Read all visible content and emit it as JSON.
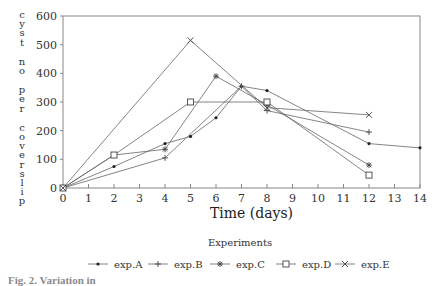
{
  "chart_data": {
    "type": "line",
    "title": "",
    "xlabel": "Time (days)",
    "ylabel": "cyst no per coverslip",
    "xlim": [
      0,
      14
    ],
    "ylim": [
      0,
      600
    ],
    "x_ticks": [
      0,
      1,
      2,
      3,
      4,
      5,
      6,
      7,
      8,
      9,
      10,
      11,
      12,
      13,
      14
    ],
    "y_ticks": [
      0,
      100,
      200,
      300,
      400,
      500,
      600
    ],
    "grid": false,
    "legend_title": "Experiments",
    "legend_position": "bottom",
    "series": [
      {
        "name": "exp.A",
        "marker": "dot",
        "x": [
          0,
          2,
          4,
          5,
          6,
          7,
          8,
          12,
          14
        ],
        "values": [
          0,
          75,
          155,
          180,
          245,
          355,
          340,
          155,
          140
        ]
      },
      {
        "name": "exp.B",
        "marker": "plus",
        "x": [
          0,
          4,
          7,
          8,
          12
        ],
        "values": [
          0,
          105,
          355,
          270,
          195
        ]
      },
      {
        "name": "exp.C",
        "marker": "star",
        "x": [
          0,
          2,
          4,
          6,
          8,
          12
        ],
        "values": [
          0,
          115,
          135,
          390,
          290,
          80
        ]
      },
      {
        "name": "exp.D",
        "marker": "square",
        "x": [
          0,
          2,
          5,
          8,
          12
        ],
        "values": [
          0,
          115,
          300,
          300,
          45
        ]
      },
      {
        "name": "exp.E",
        "marker": "x",
        "x": [
          0,
          5,
          8,
          12
        ],
        "values": [
          0,
          515,
          280,
          255
        ]
      }
    ]
  },
  "axis": {
    "ylabel_words": [
      "cyst",
      "no",
      "per",
      "coverslip"
    ],
    "xlabel": "Time (days)"
  },
  "legend": {
    "title": "Experiments",
    "items": [
      "exp.A",
      "exp.B",
      "exp.C",
      "exp.D",
      "exp.E"
    ]
  },
  "caption": "Fig. 2. Variation in"
}
